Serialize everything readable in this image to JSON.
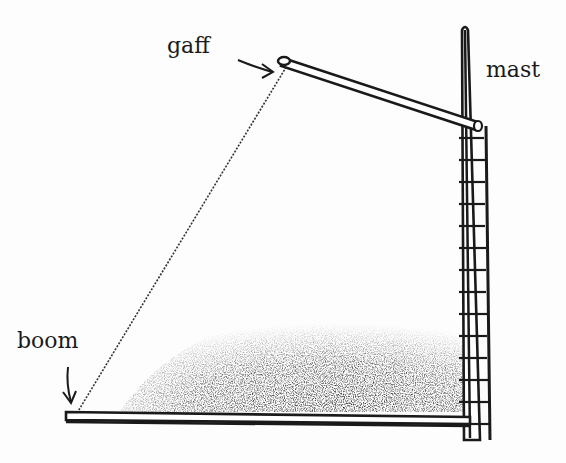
{
  "diagram": {
    "labels": {
      "gaff": "gaff",
      "mast": "mast",
      "boom": "boom"
    },
    "parts": [
      "gaff",
      "mast",
      "boom",
      "sail-leech",
      "mast-hoops",
      "sail-shading"
    ],
    "colors": {
      "ink": "#1a1a1a",
      "background": "#fdfdfd"
    }
  }
}
